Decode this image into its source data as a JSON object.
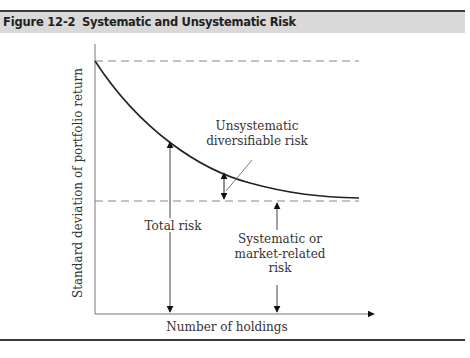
{
  "header": {
    "figure_number": "Figure 12-2",
    "title": "Systematic and Unsystematic Risk"
  },
  "axes": {
    "ylabel": "Standard deviation of portfolio return",
    "xlabel": "Number of holdings"
  },
  "annotations": {
    "unsystematic": [
      "Unsystematic",
      "diversifiable risk"
    ],
    "total": "Total risk",
    "systematic": [
      "Systematic or",
      "market-related",
      "risk"
    ]
  },
  "colors": {
    "header_bg": "#d9d9d9",
    "rule": "#3a3a3a",
    "curve": "#222222",
    "dashes": "#888888",
    "axis": "#777777",
    "text": "#333333"
  }
}
